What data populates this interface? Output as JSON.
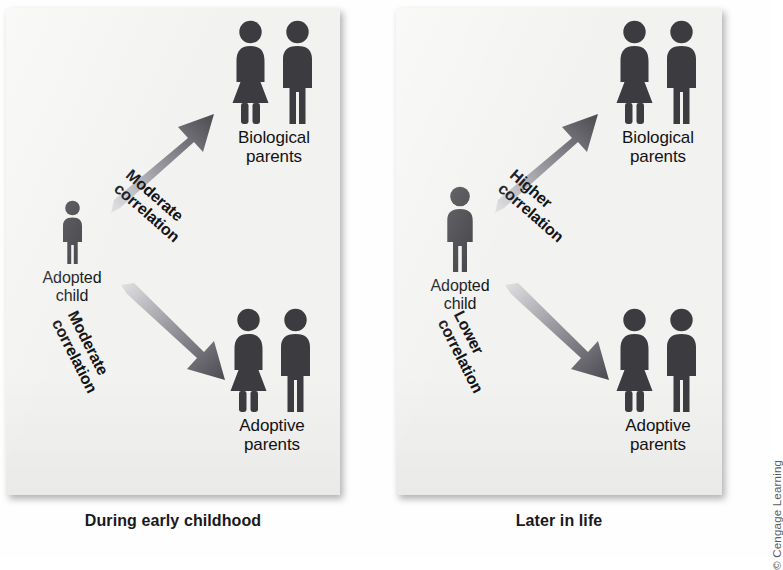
{
  "figure": {
    "copyright": "© Cengage Learning"
  },
  "panels": [
    {
      "id": "early-childhood",
      "caption": "During early childhood",
      "child": {
        "label": "Adopted\nchild",
        "icon": "child-figure-icon"
      },
      "targets": [
        {
          "id": "biological-parents",
          "label": "Biological\nparents",
          "icons": [
            "woman-figure-icon",
            "man-figure-icon"
          ]
        },
        {
          "id": "adoptive-parents",
          "label": "Adoptive\nparents",
          "icons": [
            "woman-figure-icon",
            "man-figure-icon"
          ]
        }
      ],
      "arrows": [
        {
          "id": "arrow-to-biological",
          "direction": "up-right",
          "icon": "arrow-up-right-icon",
          "label": "Moderate\ncorrelation",
          "strength": "Moderate"
        },
        {
          "id": "arrow-to-adoptive",
          "direction": "down-right",
          "icon": "arrow-down-right-icon",
          "label": "Moderate\ncorrelation",
          "strength": "Moderate"
        }
      ]
    },
    {
      "id": "later-in-life",
      "caption": "Later in life",
      "child": {
        "label": "Adopted\nchild",
        "icon": "child-figure-icon"
      },
      "targets": [
        {
          "id": "biological-parents",
          "label": "Biological\nparents",
          "icons": [
            "woman-figure-icon",
            "man-figure-icon"
          ]
        },
        {
          "id": "adoptive-parents",
          "label": "Adoptive\nparents",
          "icons": [
            "woman-figure-icon",
            "man-figure-icon"
          ]
        }
      ],
      "arrows": [
        {
          "id": "arrow-to-biological",
          "direction": "up-right",
          "icon": "arrow-up-right-icon",
          "label": "Higher\ncorrelation",
          "strength": "Higher"
        },
        {
          "id": "arrow-to-adoptive",
          "direction": "down-right",
          "icon": "arrow-down-right-icon",
          "label": "Lower\ncorrelation",
          "strength": "Lower"
        }
      ]
    }
  ],
  "bleed_through": [
    "the behavior of",
    "correlation",
    "relative",
    "environment",
    "genetic",
    "adoption studies",
    "similar to their",
    "that of a",
    "influenced by shared",
    "psychological",
    "development"
  ],
  "colors": {
    "figure_fill": "#3b3b40",
    "panel_bg": "#f2f2f0",
    "page_bg": "#fefefe",
    "text": "#121215",
    "arrow_dark": "#4a4a50",
    "arrow_light": "#d8d8da"
  }
}
